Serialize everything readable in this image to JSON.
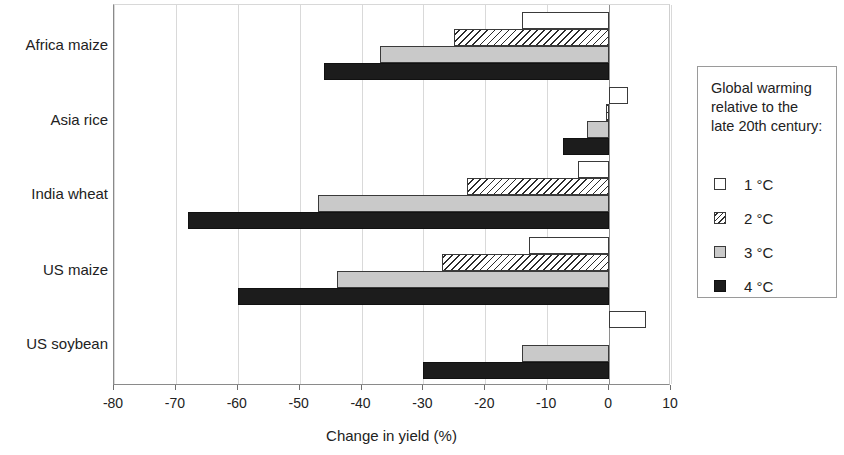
{
  "chart_data": {
    "type": "bar",
    "orientation": "horizontal",
    "title": "",
    "xlabel": "Change in yield (%)",
    "ylabel": "",
    "xlim": [
      -80,
      10
    ],
    "xticks": [
      -80,
      -70,
      -60,
      -50,
      -40,
      -30,
      -20,
      -10,
      0,
      10
    ],
    "xtick_labels": [
      "-80",
      "-70",
      "-60",
      "-50",
      "-40",
      "-30",
      "-20",
      "-10",
      "0",
      "10"
    ],
    "grid": true,
    "categories": [
      "Africa maize",
      "Asia rice",
      "India wheat",
      "US maize",
      "US soybean"
    ],
    "legend_position": "right",
    "legend_title": "Global warming relative to the late 20th century:",
    "series": [
      {
        "name": "1 °C",
        "swatch": "white",
        "color": "#ffffff",
        "values": [
          -14,
          3,
          -5,
          -13,
          6
        ]
      },
      {
        "name": "2 °C",
        "swatch": "hatched",
        "color": "#ffffff",
        "values": [
          -25,
          -0.5,
          -23,
          -27,
          0
        ]
      },
      {
        "name": "3 °C",
        "swatch": "gray",
        "color": "#c9c9c9",
        "values": [
          -37,
          -3.5,
          -47,
          -44,
          -14
        ]
      },
      {
        "name": "4 °C",
        "swatch": "black",
        "color": "#1c1c1c",
        "values": [
          -46,
          -7.5,
          -68,
          -60,
          -30
        ]
      }
    ]
  },
  "axis": {
    "x_title": "Change in yield (%)"
  },
  "legend": {
    "title_line_1": "Global warming",
    "title_line_2": "relative to the",
    "title_line_3": "late 20th century:",
    "items": [
      {
        "label": "1 °C"
      },
      {
        "label": "2 °C"
      },
      {
        "label": "3 °C"
      },
      {
        "label": "4 °C"
      }
    ]
  }
}
